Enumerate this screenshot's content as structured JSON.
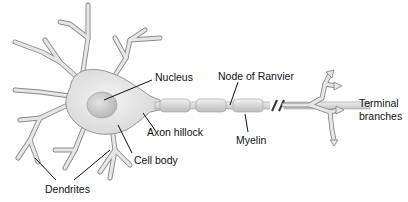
{
  "diagram": {
    "labels": {
      "nucleus": "Nucleus",
      "node_of_ranvier": "Node of Ranvier",
      "terminal_line1": "Terminal",
      "terminal_line2": "branches",
      "axon_hillock": "Axon hillock",
      "myelin": "Myelin",
      "cell_body": "Cell body",
      "dendrites": "Dendrites"
    },
    "colors": {
      "cell_fill": "#e6e6e6",
      "outline": "#8a8a8a",
      "nucleus_fill": "#cfcfcf",
      "myelin_fill": "#dcdcdc",
      "text": "#111111",
      "background": "#ffffff"
    }
  }
}
